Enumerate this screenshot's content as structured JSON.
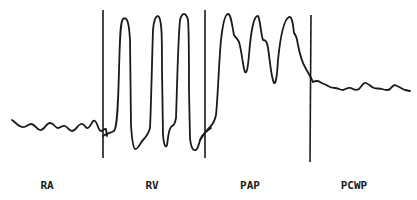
{
  "diagram": {
    "title": "",
    "colors": {
      "ink": "#1a1a1a",
      "background": "#ffffff"
    },
    "segments": [
      {
        "id": "ra",
        "label": "RA",
        "description": "Right atrial pressure waveform"
      },
      {
        "id": "rv",
        "label": "RV",
        "description": "Right ventricular pressure waveform"
      },
      {
        "id": "pap",
        "label": "PAP",
        "description": "Pulmonary artery pressure waveform"
      },
      {
        "id": "pcwp",
        "label": "PCWP",
        "description": "Pulmonary capillary wedge pressure waveform"
      }
    ]
  }
}
